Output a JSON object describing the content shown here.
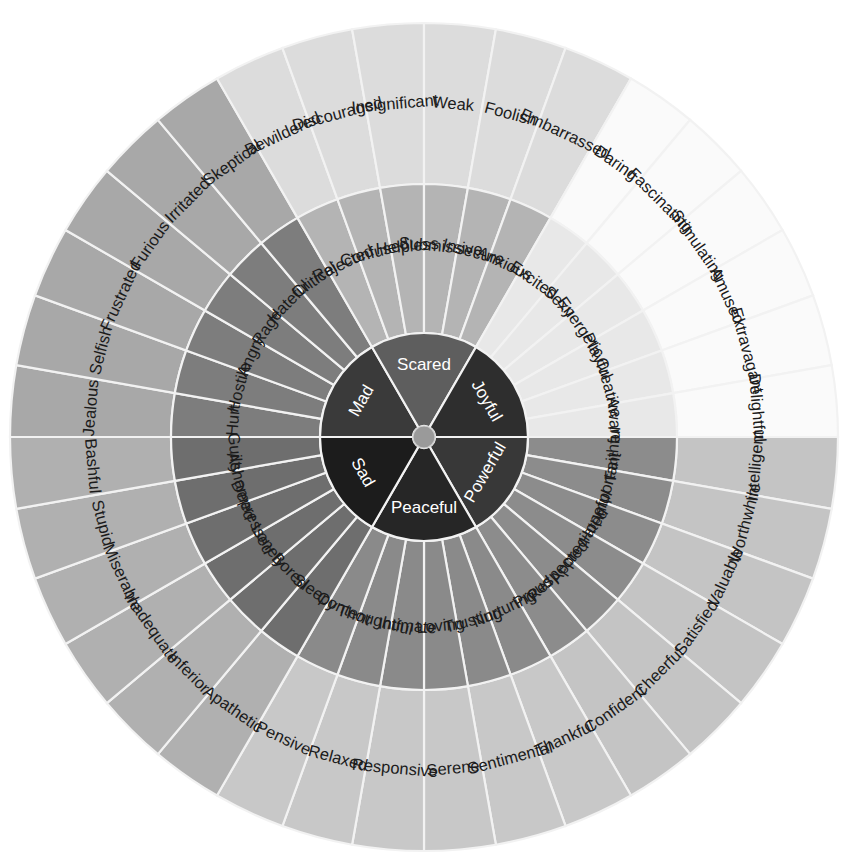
{
  "geometry": {
    "cx": 424,
    "cy": 437,
    "r_hub": 11,
    "r_core": 104,
    "r_mid": 253,
    "r_out": 414,
    "start_angle_deg": -90,
    "sector_count": 6,
    "slices_per_sector": 6
  },
  "palette": {
    "background": "#ffffff",
    "divider": "#f2f2f2",
    "hub": "#9a9a9a",
    "text_dark": "#1b1b1b",
    "text_light": "#ffffff"
  },
  "sectors": [
    {
      "core": "Mad",
      "core_color": "#3a3a3a",
      "core_text": "light",
      "mid_color": "#7d7d7d",
      "mid_text": "dark",
      "out_color": "#a8a8a8",
      "out_text": "dark",
      "middle": [
        "Hurt",
        "Hostile",
        "Angry",
        "Rage",
        "Hateful",
        "Critical"
      ],
      "outer": [
        "Jealous",
        "Selfish",
        "Frustrated",
        "Furious",
        "Irritated",
        "Skeptical"
      ]
    },
    {
      "core": "Scared",
      "core_color": "#5e5e5e",
      "core_text": "light",
      "mid_color": "#b4b4b4",
      "mid_text": "dark",
      "out_color": "#dcdcdc",
      "out_text": "dark",
      "middle": [
        "Rejected",
        "Confused",
        "Helpless",
        "Submissive",
        "Insecure",
        "Anxious"
      ],
      "outer": [
        "Bewildered",
        "Discouraged",
        "Insignificant",
        "Weak",
        "Foolish",
        "Embarrassed"
      ]
    },
    {
      "core": "Joyful",
      "core_color": "#2e2e2e",
      "core_text": "light",
      "mid_color": "#e8e8e8",
      "mid_text": "dark",
      "out_color": "#fafafa",
      "out_text": "dark",
      "middle": [
        "Excited",
        "Sexy",
        "Energetic",
        "Playful",
        "Creative",
        "Aware"
      ],
      "outer": [
        "Daring",
        "Fascinating",
        "Stimulating",
        "Amused",
        "Extravagant",
        "Delightful"
      ]
    },
    {
      "core": "Powerful",
      "core_color": "#383838",
      "core_text": "light",
      "mid_color": "#8c8c8c",
      "mid_text": "dark",
      "out_color": "#c4c4c4",
      "out_text": "dark",
      "middle": [
        "Faithful",
        "Important",
        "Hopeful",
        "Appreciated",
        "Respected",
        "Proud"
      ],
      "outer": [
        "Intelligent",
        "Worthwhile",
        "Valuable",
        "Satisfied",
        "Cheerful",
        "Confident"
      ]
    },
    {
      "core": "Peaceful",
      "core_color": "#262626",
      "core_text": "light",
      "mid_color": "#8a8a8a",
      "mid_text": "dark",
      "out_color": "#c8c8c8",
      "out_text": "dark",
      "middle": [
        "Nurturing",
        "Trusting",
        "Loving",
        "Intimate",
        "Thoughtful",
        "Content"
      ],
      "outer": [
        "Thankful",
        "Sentimental",
        "Serene",
        "Responsive",
        "Relaxed",
        "Pensive"
      ]
    },
    {
      "core": "Sad",
      "core_color": "#1c1c1c",
      "core_text": "light",
      "mid_color": "#6e6e6e",
      "mid_text": "dark",
      "out_color": "#b0b0b0",
      "out_text": "dark",
      "middle": [
        "Sleepy",
        "Bored",
        "Lonely",
        "Depressed",
        "Ashamed",
        "Guilty"
      ],
      "outer": [
        "Apathetic",
        "Inferior",
        "Inadequate",
        "Miserable",
        "Stupid",
        "Bashful"
      ]
    }
  ],
  "chart_data": {
    "type": "pie",
    "ring_names": [
      "core",
      "middle",
      "outer"
    ],
    "total_segments": 78,
    "categories": [
      "Mad",
      "Scared",
      "Joyful",
      "Powerful",
      "Peaceful",
      "Sad"
    ],
    "values": [
      1,
      1,
      1,
      1,
      1,
      1
    ],
    "legend": "none",
    "grid": false
  }
}
